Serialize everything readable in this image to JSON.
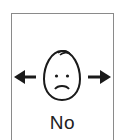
{
  "card": {
    "label": "No",
    "symbol": "head-shake-no-icon",
    "border_color": "#8a8a8a",
    "ink_color": "#1a1a1a"
  }
}
